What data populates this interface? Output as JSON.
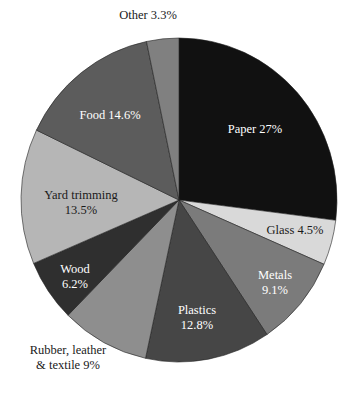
{
  "chart_data": {
    "type": "pie",
    "title": "",
    "start": "top",
    "direction": "clockwise",
    "slices": [
      {
        "name": "Paper",
        "label": [
          "Paper 27%"
        ],
        "value": 27,
        "color": "#111111",
        "text_color": "#ffffff"
      },
      {
        "name": "Glass",
        "label": [
          "Glass 4.5%"
        ],
        "value": 4.5,
        "color": "#d9d9d9",
        "text_color": "#1a1a1a"
      },
      {
        "name": "Metals",
        "label": [
          "Metals",
          "9.1%"
        ],
        "value": 9.1,
        "color": "#7b7b7b",
        "text_color": "#ffffff"
      },
      {
        "name": "Plastics",
        "label": [
          "Plastics",
          "12.8%"
        ],
        "value": 12.8,
        "color": "#464646",
        "text_color": "#ffffff"
      },
      {
        "name": "Rubber, leather & textile",
        "label": [
          "Rubber, leather",
          "& textile 9%"
        ],
        "value": 9,
        "color": "#8e8e8e",
        "text_color": "#1a1a1a"
      },
      {
        "name": "Wood",
        "label": [
          "Wood",
          "6.2%"
        ],
        "value": 6.2,
        "color": "#2f2f2f",
        "text_color": "#ffffff"
      },
      {
        "name": "Yard trimming",
        "label": [
          "Yard trimming",
          "13.5%"
        ],
        "value": 13.5,
        "color": "#b6b6b6",
        "text_color": "#1a1a1a"
      },
      {
        "name": "Food",
        "label": [
          "Food 14.6%"
        ],
        "value": 14.6,
        "color": "#5c5c5c",
        "text_color": "#ffffff"
      },
      {
        "name": "Other",
        "label": [
          "Other 3.3%"
        ],
        "value": 3.3,
        "color": "#808080",
        "text_color": "#1a1a1a"
      }
    ]
  }
}
